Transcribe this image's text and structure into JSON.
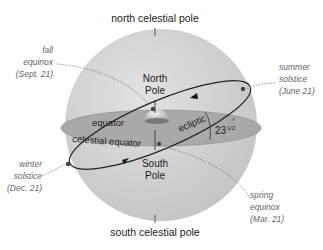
{
  "diagram": {
    "labels": {
      "north_celestial_pole": "north celestial pole",
      "south_celestial_pole": "south celestial pole",
      "north_pole": [
        "North",
        "Pole"
      ],
      "south_pole": [
        "South",
        "Pole"
      ],
      "equator": "equator",
      "celestial_equator": "celestial equator",
      "ecliptic": "ecliptic",
      "tilt_angle": "23",
      "tilt_fraction": "1/2",
      "tilt_degree": "°"
    },
    "events": {
      "fall_equinox": [
        "fall",
        "equinox",
        "(Sept. 21)"
      ],
      "summer_solstice": [
        "summer",
        "solstice",
        "(June 21)"
      ],
      "winter_solstice": [
        "winter",
        "solstice",
        "(Dec. 21)"
      ],
      "spring_equinox": [
        "spring",
        "equinox",
        "(Mar. 21)"
      ]
    },
    "colors": {
      "sphere": "#d4d4d4",
      "sphere_shade": "#bdbdbd",
      "equator_plane": "#a9a9a9",
      "text": "#222222",
      "italic_text": "#666666"
    }
  }
}
